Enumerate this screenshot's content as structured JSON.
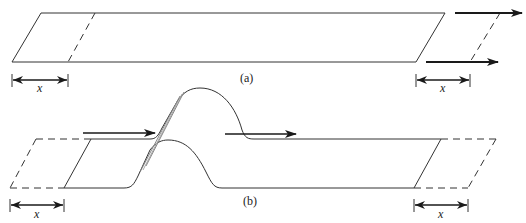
{
  "figure": {
    "panel_a": {
      "label": "(a)",
      "dimension_left": "x",
      "dimension_right": "x",
      "arrows": [
        "top-shear-arrow",
        "bottom-shear-arrow"
      ]
    },
    "panel_b": {
      "label": "(b)",
      "dimension_left": "x",
      "dimension_right": "x",
      "arrows": [
        "left-propagation-arrow",
        "right-propagation-arrow"
      ]
    },
    "colors": {
      "stroke": "#333333",
      "arrow": "#1a1a1a",
      "background": "#ffffff"
    }
  }
}
